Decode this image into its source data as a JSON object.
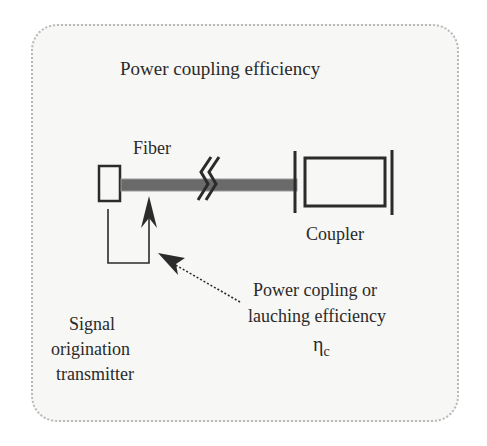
{
  "diagram": {
    "title": "Power coupling efficiency",
    "labels": {
      "fiber": "Fiber",
      "coupler": "Coupler",
      "efficiency_line1": "Power copling or",
      "efficiency_line2": "lauching efficiency",
      "efficiency_symbol": "η",
      "efficiency_subscript": "c",
      "transmitter_line1": "Signal",
      "transmitter_line2": "origination",
      "transmitter_line3": "transmitter"
    },
    "components": [
      "transmitter",
      "fiber",
      "break-symbol",
      "coupler"
    ],
    "colors": {
      "fiber": "#6a6a6a",
      "stroke": "#2b2b2b",
      "panel_bg": "#f7f7f5",
      "panel_border": "#b9b9b9"
    }
  }
}
